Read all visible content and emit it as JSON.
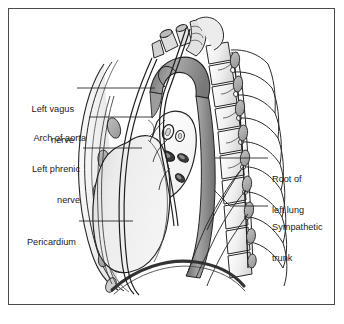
{
  "figure": {
    "border_color": "#4a4a4a",
    "background": "#ffffff",
    "text_color": "#1b1b1b",
    "leader_color": "#2a2a2a"
  },
  "labels": {
    "left": [
      {
        "id": "left-vagus-nerve",
        "line1": "Left vagus",
        "line2": "nerve"
      },
      {
        "id": "arch-of-aorta",
        "line1": "Arch of aorta",
        "line2": ""
      },
      {
        "id": "left-phrenic-nerve",
        "line1": "Left phrenic",
        "line2": "nerve"
      },
      {
        "id": "pericardium",
        "line1": "Pericardium",
        "line2": ""
      }
    ],
    "right": [
      {
        "id": "root-of-left-lung",
        "line1": "Root of",
        "line2": "left lung"
      },
      {
        "id": "sympathetic-trunk",
        "line1": "Sympathetic",
        "line2": "trunk"
      }
    ]
  },
  "structures": [
    {
      "id": "pericardium",
      "name": "Pericardium",
      "shade": "#e9e9e9"
    },
    {
      "id": "arch-of-aorta",
      "name": "Arch of aorta",
      "shade": "#8f8f8f"
    },
    {
      "id": "descending-aorta",
      "name": "Descending thoracic aorta",
      "shade": "#8a8a8a"
    },
    {
      "id": "root-of-left-lung",
      "name": "Root of left lung",
      "shade": "#ffffff"
    },
    {
      "id": "left-vagus-nerve",
      "name": "Left vagus nerve",
      "shade": "#d8d8d8"
    },
    {
      "id": "left-phrenic-nerve",
      "name": "Left phrenic nerve",
      "shade": "#d8d8d8"
    },
    {
      "id": "sympathetic-trunk",
      "name": "Sympathetic trunk",
      "shade": "#b4b4b4"
    },
    {
      "id": "vertebral-column",
      "name": "Vertebral column",
      "shade": "#f2f2f2"
    },
    {
      "id": "ribs",
      "name": "Ribs",
      "shade": "#ededed"
    },
    {
      "id": "diaphragm",
      "name": "Diaphragm",
      "shade": "#4a4a4a"
    },
    {
      "id": "costal-cartilages",
      "name": "Costal cartilages",
      "shade": "#c9c9c9"
    },
    {
      "id": "trachea",
      "name": "Trachea",
      "shade": "#e0e0e0"
    },
    {
      "id": "great-vessel-stumps",
      "name": "Great vessel stumps",
      "shade": "#dcdcdc"
    }
  ]
}
